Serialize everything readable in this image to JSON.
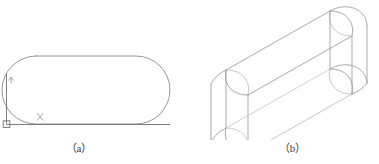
{
  "sheet": {
    "background_color": "#ffffff",
    "line_color": "#8a8a8a",
    "line_color_light": "#b4b4b4",
    "text_color": "#3d3d3d"
  },
  "figures": [
    {
      "id": "figure-a",
      "caption": "（a）",
      "description": "2D obround slot profile with UCS origin marker",
      "kind": "2d-profile",
      "annotations": {
        "x_axis_label": "X",
        "y_axis_label": "Y",
        "origin_marker": "ucs-origin-square"
      },
      "geometry": {
        "left_cap_center_x": 36,
        "right_cap_center_x": 136,
        "top_y": 56,
        "bottom_y": 124,
        "radius": 34,
        "origin_x": 6,
        "origin_y": 124
      }
    },
    {
      "id": "figure-b",
      "caption": "（b）",
      "description": "Isometric wireframe of extruded obround solid",
      "kind": "3d-isometric",
      "geometry": {
        "height": 58,
        "axis_long": 118,
        "radius": 30
      }
    }
  ],
  "captions": {
    "a": "（a）",
    "b": "（b）"
  },
  "labels": {
    "x": "X",
    "y": "Y"
  }
}
